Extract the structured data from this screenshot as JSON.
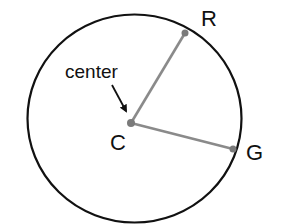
{
  "diagram": {
    "type": "circle-radii",
    "circle": {
      "cx": 134.5,
      "cy": 118.5,
      "rx": 107,
      "ry": 104,
      "stroke": "#111111"
    },
    "center_point": {
      "label": "C",
      "x": 131,
      "y": 123
    },
    "center_annotation": {
      "text": "center",
      "x": 65,
      "y": 78
    },
    "points": [
      {
        "label": "R",
        "x": 185,
        "y": 33
      },
      {
        "label": "G",
        "x": 233,
        "y": 149
      }
    ],
    "radius_color": "#8a8a8a",
    "labels": {
      "R": "R",
      "G": "G",
      "C": "C",
      "center": "center"
    }
  }
}
